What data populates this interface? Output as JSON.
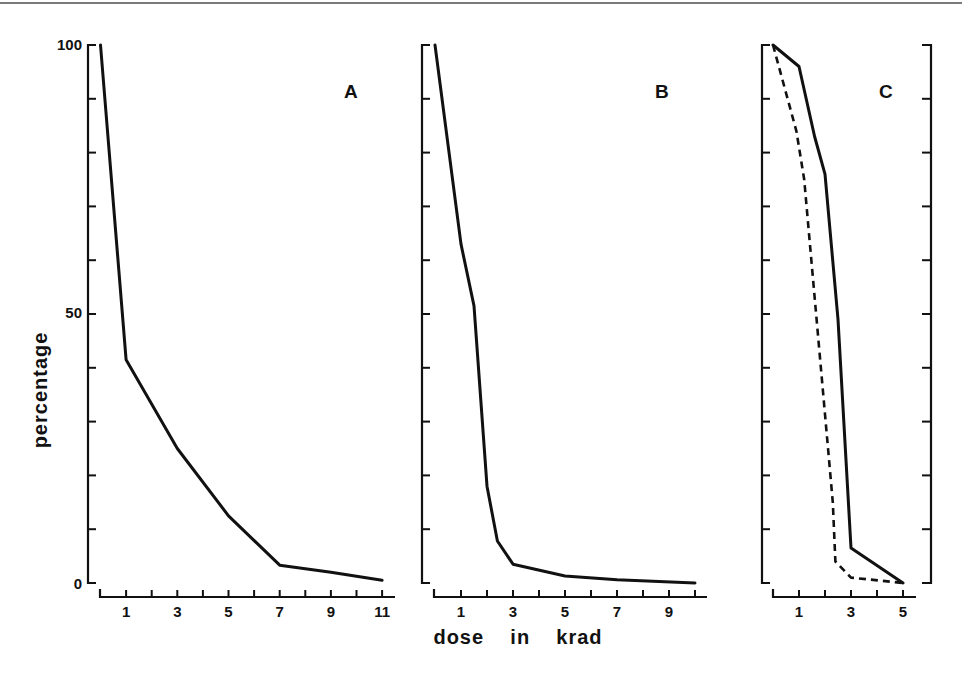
{
  "chart_data": [
    {
      "type": "line",
      "panel": "A",
      "title": "A",
      "xlabel": "dose in krad",
      "ylabel": "percentage",
      "xlim": [
        0,
        11.5
      ],
      "ylim": [
        0,
        100
      ],
      "x_ticks": [
        1,
        3,
        5,
        7,
        9,
        11
      ],
      "x_minor_ticks": [
        2,
        4,
        6,
        8,
        10
      ],
      "y_ticks": [
        0,
        50,
        100
      ],
      "y_minor_ticks": [
        10,
        20,
        30,
        40,
        60,
        70,
        80,
        90
      ],
      "grid": false,
      "series": [
        {
          "name": "survival",
          "style": "solid",
          "x": [
            0,
            1,
            3,
            5,
            7,
            9,
            11
          ],
          "values": [
            100,
            41.5,
            25,
            12.5,
            3.3,
            2,
            0.5
          ]
        }
      ]
    },
    {
      "type": "line",
      "panel": "B",
      "title": "B",
      "xlabel": "dose in krad",
      "ylabel": "percentage",
      "xlim": [
        0,
        10.5
      ],
      "ylim": [
        0,
        100
      ],
      "x_ticks": [
        1,
        3,
        5,
        7,
        9
      ],
      "x_minor_ticks": [
        2,
        4,
        6,
        8,
        10
      ],
      "y_ticks": [
        0,
        50,
        100
      ],
      "grid": false,
      "series": [
        {
          "name": "survival",
          "style": "solid",
          "x": [
            0,
            1,
            1.5,
            2,
            2.4,
            3,
            5,
            7,
            10
          ],
          "values": [
            100,
            63,
            51.5,
            18,
            7.8,
            3.5,
            1.3,
            0.6,
            0
          ]
        }
      ]
    },
    {
      "type": "line",
      "panel": "C",
      "title": "C",
      "xlabel": "dose in krad",
      "ylabel": "percentage",
      "xlim": [
        0,
        5.5
      ],
      "ylim": [
        0,
        100
      ],
      "x_ticks": [
        1,
        3,
        5
      ],
      "x_minor_ticks": [
        2,
        4
      ],
      "y_ticks": [
        0,
        50,
        100
      ],
      "grid": false,
      "series": [
        {
          "name": "solid curve",
          "style": "solid",
          "x": [
            0,
            1,
            1.6,
            2,
            2.5,
            3,
            5
          ],
          "values": [
            100,
            96,
            83,
            76,
            49,
            6.5,
            0
          ]
        },
        {
          "name": "dashed curve",
          "style": "dashed",
          "x": [
            0,
            0.9,
            1.2,
            2.3,
            2.4,
            3,
            5
          ],
          "values": [
            100,
            84,
            75,
            15,
            4,
            1,
            0
          ]
        }
      ]
    }
  ],
  "labels": {
    "y_axis": "percentage",
    "x_axis": "dose    in    krad",
    "y_tick_100": "100",
    "y_tick_50": "50",
    "y_tick_0": "0",
    "panel_a": "A",
    "panel_b": "B",
    "panel_c": "C"
  }
}
